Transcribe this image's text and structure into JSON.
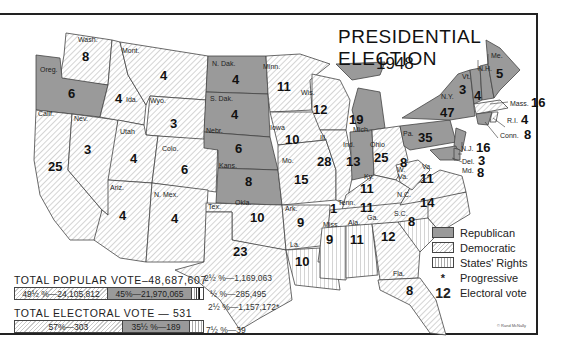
{
  "title": "PRESIDENTIAL ELECTION",
  "year": "1948",
  "colors": {
    "republican": "#9a9a9a",
    "democratic_hatch": "#c8c8c8",
    "states_rights_lines": "#aaaaaa",
    "border": "#444444"
  },
  "legend": {
    "items": [
      {
        "key": "republican",
        "label": "Republican"
      },
      {
        "key": "democratic",
        "label": "Democratic"
      },
      {
        "key": "states_rights",
        "label": "States' Rights"
      },
      {
        "key": "progressive",
        "symbol": "*",
        "label": "Progressive"
      },
      {
        "key": "electoral_vote",
        "symbol": "12",
        "label": "Electoral vote"
      }
    ]
  },
  "popular_vote": {
    "header": "TOTAL POPULAR VOTE–48,687,607",
    "segments": [
      {
        "party": "democratic",
        "label": "49½ %—24,105,812"
      },
      {
        "party": "republican",
        "label": "45%—21,970,065"
      }
    ],
    "notes": {
      "states_rights": "2½ %—1,169,063",
      "other": "½ %—285,495",
      "progressive": "2½ %—1,157,172*"
    }
  },
  "electoral_vote": {
    "header": "TOTAL ELECTORAL VOTE — 531",
    "segments": [
      {
        "party": "democratic",
        "label": "57%—303"
      },
      {
        "party": "republican",
        "label": "35½ %—189"
      }
    ],
    "notes": {
      "states_rights": "7½ %—39"
    }
  },
  "states": [
    {
      "abbr": "Wash.",
      "votes": "8",
      "party": "democratic"
    },
    {
      "abbr": "Oreg.",
      "votes": "6",
      "party": "republican"
    },
    {
      "abbr": "Calif.",
      "votes": "25",
      "party": "democratic"
    },
    {
      "abbr": "Nev.",
      "votes": "3",
      "party": "democratic"
    },
    {
      "abbr": "Ida.",
      "votes": "4",
      "party": "democratic"
    },
    {
      "abbr": "Mont.",
      "votes": "4",
      "party": "democratic"
    },
    {
      "abbr": "Wyo.",
      "votes": "3",
      "party": "democratic"
    },
    {
      "abbr": "Utah",
      "votes": "4",
      "party": "democratic"
    },
    {
      "abbr": "Colo.",
      "votes": "6",
      "party": "democratic"
    },
    {
      "abbr": "Ariz.",
      "votes": "4",
      "party": "democratic"
    },
    {
      "abbr": "N. Mex.",
      "votes": "4",
      "party": "democratic"
    },
    {
      "abbr": "N. Dak.",
      "votes": "4",
      "party": "republican"
    },
    {
      "abbr": "S. Dak.",
      "votes": "4",
      "party": "republican"
    },
    {
      "abbr": "Nebr.",
      "votes": "6",
      "party": "republican"
    },
    {
      "abbr": "Kans.",
      "votes": "8",
      "party": "republican"
    },
    {
      "abbr": "Okla.",
      "votes": "10",
      "party": "democratic"
    },
    {
      "abbr": "Tex.",
      "votes": "23",
      "party": "democratic"
    },
    {
      "abbr": "Minn.",
      "votes": "11",
      "party": "democratic"
    },
    {
      "abbr": "Iowa",
      "votes": "10",
      "party": "democratic"
    },
    {
      "abbr": "Mo.",
      "votes": "15",
      "party": "democratic"
    },
    {
      "abbr": "Ark.",
      "votes": "9",
      "party": "democratic"
    },
    {
      "abbr": "La.",
      "votes": "10",
      "party": "states_rights"
    },
    {
      "abbr": "Wis.",
      "votes": "12",
      "party": "democratic"
    },
    {
      "abbr": "Ill.",
      "votes": "28",
      "party": "democratic"
    },
    {
      "abbr": "Mich.",
      "votes": "19",
      "party": "republican"
    },
    {
      "abbr": "Ind.",
      "votes": "13",
      "party": "republican"
    },
    {
      "abbr": "Ohio",
      "votes": "25",
      "party": "democratic"
    },
    {
      "abbr": "Ky.",
      "votes": "11",
      "party": "democratic"
    },
    {
      "abbr": "Tenn.",
      "votes": "11",
      "party": "democratic",
      "split": "1 States' Rights"
    },
    {
      "abbr": "Miss.",
      "votes": "9",
      "party": "states_rights"
    },
    {
      "abbr": "Ala.",
      "votes": "11",
      "party": "states_rights"
    },
    {
      "abbr": "Ga.",
      "votes": "12",
      "party": "democratic"
    },
    {
      "abbr": "Fla.",
      "votes": "8",
      "party": "democratic"
    },
    {
      "abbr": "S.C.",
      "votes": "8",
      "party": "states_rights"
    },
    {
      "abbr": "N.C.",
      "votes": "14",
      "party": "democratic"
    },
    {
      "abbr": "Va.",
      "votes": "11",
      "party": "democratic"
    },
    {
      "abbr": "W. Va.",
      "votes": "8",
      "party": "democratic"
    },
    {
      "abbr": "Pa.",
      "votes": "35",
      "party": "republican"
    },
    {
      "abbr": "N.Y.",
      "votes": "47",
      "party": "republican"
    },
    {
      "abbr": "Vt.",
      "votes": "3",
      "party": "republican"
    },
    {
      "abbr": "N.H.",
      "votes": "4",
      "party": "republican"
    },
    {
      "abbr": "Me.",
      "votes": "5",
      "party": "republican"
    },
    {
      "abbr": "Mass.",
      "votes": "16",
      "party": "democratic"
    },
    {
      "abbr": "R.I.",
      "votes": "4",
      "party": "democratic"
    },
    {
      "abbr": "Conn.",
      "votes": "8",
      "party": "republican"
    },
    {
      "abbr": "N.J.",
      "votes": "16",
      "party": "republican"
    },
    {
      "abbr": "Del.",
      "votes": "3",
      "party": "republican"
    },
    {
      "abbr": "Md.",
      "votes": "8",
      "party": "republican"
    }
  ],
  "credit": "© Rand McNally"
}
